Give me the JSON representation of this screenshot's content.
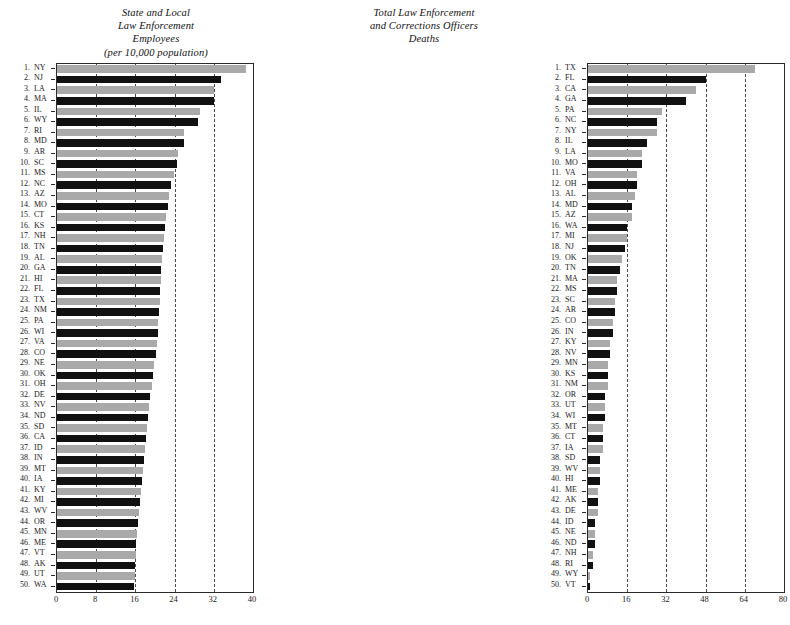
{
  "charts": [
    {
      "id": "state-local-law-enforcement-employees",
      "title": "State and Local\nLaw Enforcement\nEmployees\n(per 10,000 population)",
      "xticks": [
        0,
        8,
        16,
        24,
        32,
        40
      ],
      "gridlines": [
        8,
        16,
        24,
        32
      ],
      "xmin": 0,
      "xmax": 40,
      "chart_data": {
        "type": "bar",
        "title": "State and Local Law Enforcement Employees (per 10,000 population)",
        "xlabel": "",
        "ylabel": "",
        "xlim": [
          0,
          40
        ],
        "grid": true,
        "orientation": "horizontal",
        "categories": [
          "NY",
          "NJ",
          "LA",
          "MA",
          "IL",
          "WY",
          "RI",
          "MD",
          "AR",
          "SC",
          "MS",
          "NC",
          "AZ",
          "MO",
          "CT",
          "KS",
          "NH",
          "TN",
          "AL",
          "GA",
          "HI",
          "FL",
          "TX",
          "NM",
          "PA",
          "WI",
          "VA",
          "CO",
          "NE",
          "OK",
          "OH",
          "DE",
          "NV",
          "ND",
          "SD",
          "CA",
          "ID",
          "IN",
          "MT",
          "IA",
          "KY",
          "MI",
          "WV",
          "OR",
          "MN",
          "ME",
          "VT",
          "AK",
          "UT",
          "WA"
        ],
        "values": [
          38.6,
          33.4,
          32.0,
          32.0,
          29.1,
          28.8,
          26.0,
          26.0,
          24.6,
          24.4,
          23.8,
          23.2,
          22.8,
          22.6,
          22.2,
          22.0,
          21.8,
          21.7,
          21.5,
          21.3,
          21.2,
          21.1,
          21.0,
          20.9,
          20.7,
          20.6,
          20.4,
          20.2,
          19.8,
          19.5,
          19.3,
          19.0,
          18.8,
          18.6,
          18.4,
          18.2,
          18.0,
          17.8,
          17.6,
          17.4,
          17.2,
          17.0,
          16.8,
          16.6,
          16.4,
          16.2,
          16.1,
          16.0,
          15.9,
          15.8
        ]
      }
    },
    {
      "id": "total-law-enforcement-and-corrections-officers-deaths",
      "title": "Total Law Enforcement\nand Corrections Officers\nDeaths",
      "xticks": [
        0,
        16,
        32,
        48,
        64,
        80
      ],
      "gridlines": [
        16,
        32,
        48,
        64
      ],
      "xmin": 0,
      "xmax": 80,
      "chart_data": {
        "type": "bar",
        "title": "Total Law Enforcement and Corrections Officers Deaths",
        "xlabel": "",
        "ylabel": "",
        "xlim": [
          0,
          80
        ],
        "grid": true,
        "orientation": "horizontal",
        "categories": [
          "TX",
          "FL",
          "CA",
          "GA",
          "PA",
          "NC",
          "NY",
          "IL",
          "LA",
          "MO",
          "VA",
          "OH",
          "AL",
          "MD",
          "AZ",
          "WA",
          "MI",
          "NJ",
          "OK",
          "TN",
          "MA",
          "MS",
          "SC",
          "AR",
          "CO",
          "IN",
          "KY",
          "NV",
          "MN",
          "KS",
          "NM",
          "OR",
          "UT",
          "WI",
          "MT",
          "CT",
          "IA",
          "SD",
          "WV",
          "HI",
          "ME",
          "AK",
          "DE",
          "ID",
          "NE",
          "ND",
          "NH",
          "RI",
          "WY",
          "VT"
        ],
        "values": [
          68,
          48,
          44,
          40,
          30,
          28,
          28,
          24,
          22,
          22,
          20,
          20,
          19,
          18,
          18,
          16,
          16,
          15,
          14,
          13,
          12,
          12,
          11,
          11,
          10,
          10,
          9,
          9,
          8,
          8,
          8,
          7,
          7,
          7,
          6,
          6,
          6,
          5,
          5,
          5,
          4,
          4,
          4,
          3,
          3,
          3,
          2,
          2,
          1,
          1
        ]
      }
    }
  ],
  "colors": {
    "bar_dark": "#111111",
    "bar_light": "#a9a9a9",
    "axis": "#2b2b2b",
    "gridline": "#4a4a4a",
    "background": "#ffffff"
  }
}
